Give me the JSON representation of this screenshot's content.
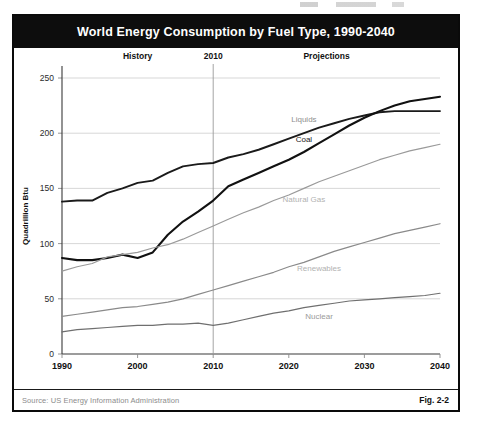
{
  "figure": {
    "title": "World Energy Consumption by Fuel Type, 1990-2040",
    "source": "Source:  US Energy Information Administration",
    "fig_number": "Fig. 2-2"
  },
  "annotations": {
    "history": "History",
    "divider_year": "2010",
    "projections": "Projections"
  },
  "chart_data": {
    "type": "line",
    "title": "World Energy Consumption by Fuel Type, 1990-2040",
    "xlabel": "",
    "ylabel": "Quadrillion Btu",
    "xlim": [
      1990,
      2040
    ],
    "ylim": [
      0,
      250
    ],
    "yticks": [
      0,
      50,
      100,
      150,
      200,
      250
    ],
    "xticks": [
      1990,
      2000,
      2010,
      2020,
      2030,
      2040
    ],
    "grid": true,
    "legend": "inline-labels",
    "history_end": 2010,
    "x": [
      1990,
      1992,
      1994,
      1996,
      1998,
      2000,
      2002,
      2004,
      2006,
      2008,
      2010,
      2012,
      2014,
      2016,
      2018,
      2020,
      2022,
      2024,
      2026,
      2028,
      2030,
      2032,
      2034,
      2036,
      2038,
      2040
    ],
    "series": [
      {
        "name": "Liquids",
        "color": "#1a1a1a",
        "label_color": "#8f8f8f",
        "values": [
          138,
          139,
          139,
          146,
          150,
          155,
          157,
          164,
          170,
          172,
          173,
          178,
          181,
          185,
          190,
          195,
          200,
          205,
          209,
          213,
          216,
          219,
          220,
          220,
          220,
          220
        ]
      },
      {
        "name": "Coal",
        "color": "#111111",
        "label_color": "#1a1a1a",
        "values": [
          87,
          85,
          85,
          87,
          90,
          87,
          92,
          108,
          120,
          129,
          139,
          152,
          158,
          164,
          170,
          176,
          183,
          191,
          199,
          207,
          214,
          220,
          225,
          229,
          231,
          233
        ]
      },
      {
        "name": "Natural Gas",
        "color": "#9a9a9a",
        "label_color": "#b2b2b2",
        "values": [
          75,
          79,
          82,
          88,
          90,
          92,
          96,
          99,
          104,
          110,
          116,
          122,
          128,
          133,
          139,
          144,
          150,
          156,
          161,
          166,
          171,
          176,
          180,
          184,
          187,
          190
        ]
      },
      {
        "name": "Renewables",
        "color": "#8a8a8a",
        "label_color": "#b2b2b2",
        "values": [
          34,
          36,
          38,
          40,
          42,
          43,
          45,
          47,
          50,
          54,
          58,
          62,
          66,
          70,
          74,
          79,
          83,
          88,
          93,
          97,
          101,
          105,
          109,
          112,
          115,
          118
        ]
      },
      {
        "name": "Nuclear",
        "color": "#6f6f6f",
        "label_color": "#9a9a9a",
        "values": [
          20,
          22,
          23,
          24,
          25,
          26,
          26,
          27,
          27,
          28,
          26,
          28,
          31,
          34,
          37,
          39,
          42,
          44,
          46,
          48,
          49,
          50,
          51,
          52,
          53,
          55
        ]
      }
    ]
  }
}
